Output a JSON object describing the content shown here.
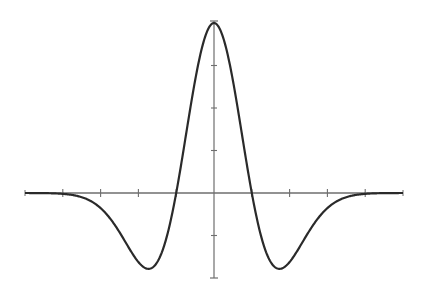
{
  "chart_data": {
    "type": "line",
    "title": "",
    "xlabel": "",
    "ylabel": "",
    "xlim": [
      -5,
      5
    ],
    "ylim": [
      -0.5,
      1.0
    ],
    "x_ticks": [
      -4,
      -3,
      -2,
      -1,
      0,
      1,
      2,
      3,
      4
    ],
    "y_ticks": [
      -0.25,
      0.25,
      0.5,
      0.75
    ],
    "tick_labels_shown": false,
    "grid": false,
    "legend": null,
    "series": [
      {
        "name": "Mexican hat wavelet (1 - t^2) e^(-t^2/2)",
        "x": [
          -5,
          -4,
          -3,
          -2.5,
          -2,
          -1.732,
          -1.5,
          -1,
          -0.5,
          0,
          0.5,
          1,
          1.5,
          1.732,
          2,
          2.5,
          3,
          4,
          5
        ],
        "values": [
          0,
          -0.005,
          -0.089,
          -0.23,
          -0.406,
          -0.446,
          -0.405,
          0,
          0.662,
          1.0,
          0.662,
          0,
          -0.405,
          -0.446,
          -0.406,
          -0.23,
          -0.089,
          -0.005,
          0
        ]
      }
    ],
    "colors": {
      "curve": "#2a2a2a",
      "axis": "#6e6e6e",
      "background": "#ffffff"
    }
  }
}
